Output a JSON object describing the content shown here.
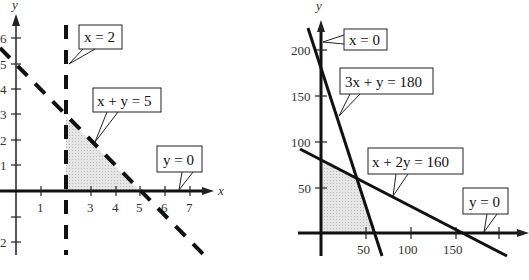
{
  "left_graph": {
    "x_axis_label": "x",
    "y_axis_label": "y",
    "x_ticks": [
      "1",
      "3",
      "4",
      "5",
      "6",
      "7"
    ],
    "y_ticks": [
      "6",
      "5",
      "4",
      "3",
      "2",
      "1",
      "2"
    ],
    "callouts": {
      "x_eq_2": "x = 2",
      "x_plus_y_eq_5": "x + y = 5",
      "y_eq_0": "y = 0"
    },
    "feasible_region": "triangle (2,0),(2,3),(5,0)"
  },
  "right_graph": {
    "x_axis_label": "",
    "y_axis_label": "y",
    "x_ticks": [
      "50",
      "100",
      "150"
    ],
    "y_ticks": [
      "200",
      "150",
      "100",
      "50"
    ],
    "callouts": {
      "x_eq_0": "x = 0",
      "three_x_plus_y_eq_180": "3x + y = 180",
      "x_plus_2y_eq_160": "x + 2y = 160",
      "y_eq_0": "y = 0"
    },
    "feasible_region": "polygon (0,0),(0,80),(40,60),(60,0)"
  },
  "colors": {
    "line": "#111111",
    "shade": "#d8d8d8",
    "axis": "#222222"
  }
}
